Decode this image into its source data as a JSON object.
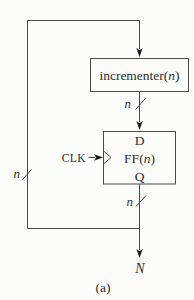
{
  "figure": {
    "incrementer": {
      "prefix": "incrementer(",
      "var": "n",
      "suffix": ")"
    },
    "ff": {
      "input_port": "D",
      "prefix": "FF(",
      "var": "n",
      "suffix": ")",
      "output_port": "Q"
    },
    "clk_label": "CLK",
    "bus_widths": {
      "incrementer_out": "n",
      "feedback": "n",
      "ff_out": "n"
    },
    "output_label": "N",
    "caption": "(a)"
  },
  "colors": {
    "wire": "#474747",
    "ink": "#2e2e2e",
    "paper": "#fcfcfa"
  }
}
